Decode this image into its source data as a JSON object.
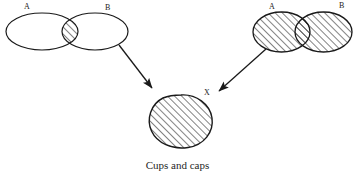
{
  "figure": {
    "caption": "Cups and caps",
    "stroke_color": "#1a1a1a",
    "hatch_color": "#1a1a1a",
    "background_color": "#ffffff"
  },
  "diagrams": {
    "intersection": {
      "name": "cap",
      "label_a": "A",
      "label_b": "B",
      "shaded_region": "intersection"
    },
    "union": {
      "name": "cup",
      "label_a": "A",
      "label_b": "B",
      "shaded_region": "union"
    },
    "result": {
      "label_x": "X",
      "shaded_region": "whole"
    }
  },
  "arrows": [
    {
      "name": "arrow-from-intersection-to-result"
    },
    {
      "name": "arrow-from-union-to-result"
    }
  ]
}
